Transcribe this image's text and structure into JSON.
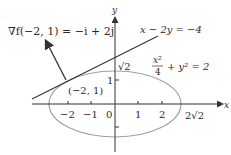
{
  "diagram": {
    "gradient_label": "∇f(−2, 1) = −i + 2j",
    "line_label": "x − 2y = −4",
    "ellipse_label_num": "x²",
    "ellipse_label_den": "4",
    "ellipse_label_rest": "+ y² = 2",
    "point_label": "(−2, 1)",
    "y_intercept_label": "√2",
    "x_intercept_label": "2√2",
    "axis_x_label": "x",
    "axis_y_label": "y",
    "x_ticks": [
      "−2",
      "−1",
      "0",
      "1",
      "2"
    ],
    "y_ticks": [
      "1"
    ],
    "colors": {
      "axis": "#333333",
      "ellipse": "#a0a0a0",
      "line": "#333333",
      "arrow": "#333333",
      "text": "#2a2a2a"
    }
  }
}
